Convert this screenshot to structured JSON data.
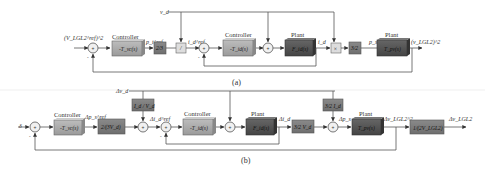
{
  "diagram_a": {
    "caption": "(a)",
    "input_label": "(V_LGL2^ref)^2",
    "disturbance_label": "v_d",
    "output_label": "(v_LGL2)^2",
    "blocks": [
      {
        "id": "ctrl1",
        "header": "Controller",
        "text": "-T_vc(s)",
        "type": "controller"
      },
      {
        "id": "gain1",
        "header": "",
        "text": "2/3",
        "type": "gain"
      },
      {
        "id": "div",
        "header": "",
        "text": "/",
        "type": "light"
      },
      {
        "id": "ctrl2",
        "header": "Controller",
        "text": "-T_id(s)",
        "type": "controller"
      },
      {
        "id": "plant1",
        "header": "Plant",
        "text": "F_id(s)",
        "type": "plant"
      },
      {
        "id": "mult",
        "header": "",
        "text": "×",
        "type": "light"
      },
      {
        "id": "gain2",
        "header": "",
        "text": "3/2",
        "type": "gain"
      },
      {
        "id": "plant2",
        "header": "Plant",
        "text": "T_pv(s)",
        "type": "plant"
      }
    ],
    "signals": {
      "p_ref": "p_t^ref",
      "i_ref": "i_d^ref",
      "i_d": "i_d",
      "p": "p_s"
    }
  },
  "diagram_b": {
    "caption": "(b)",
    "input_label": "δ",
    "disturbance_label": "Δv_d",
    "output_label": "Δv_LGL2",
    "blocks": [
      {
        "id": "ctrl1",
        "header": "Controller",
        "text": "-T_vc(s)",
        "type": "controller"
      },
      {
        "id": "gain1",
        "header": "",
        "text": "2/(3V_d)",
        "type": "gain"
      },
      {
        "id": "ff1",
        "header": "",
        "text": "I_d / V_d",
        "type": "gain"
      },
      {
        "id": "ctrl2",
        "header": "Controller",
        "text": "-T_id(s)",
        "type": "controller"
      },
      {
        "id": "plant1",
        "header": "Plant",
        "text": "F_id(s)",
        "type": "plant"
      },
      {
        "id": "gain2",
        "header": "",
        "text": "3/2 V_d",
        "type": "gain"
      },
      {
        "id": "ff2",
        "header": "",
        "text": "3/2 I_d",
        "type": "gain"
      },
      {
        "id": "plant2",
        "header": "Plant",
        "text": "T_pv(s)",
        "type": "plant"
      },
      {
        "id": "gain3",
        "header": "",
        "text": "1/(2V_LGL2)",
        "type": "gain"
      }
    ],
    "signals": {
      "dp_ref": "Δp_s^ref",
      "di_ref": "Δi_d^ref",
      "di_d": "Δi_d",
      "dp": "Δp_s",
      "dv2": "Δv_LGL2^2"
    }
  },
  "colors": {
    "controller": "#a9a9a9",
    "gain": "#7a7a7a",
    "plant": "#555555",
    "light": "#d8d8d8",
    "line": "#555555"
  }
}
